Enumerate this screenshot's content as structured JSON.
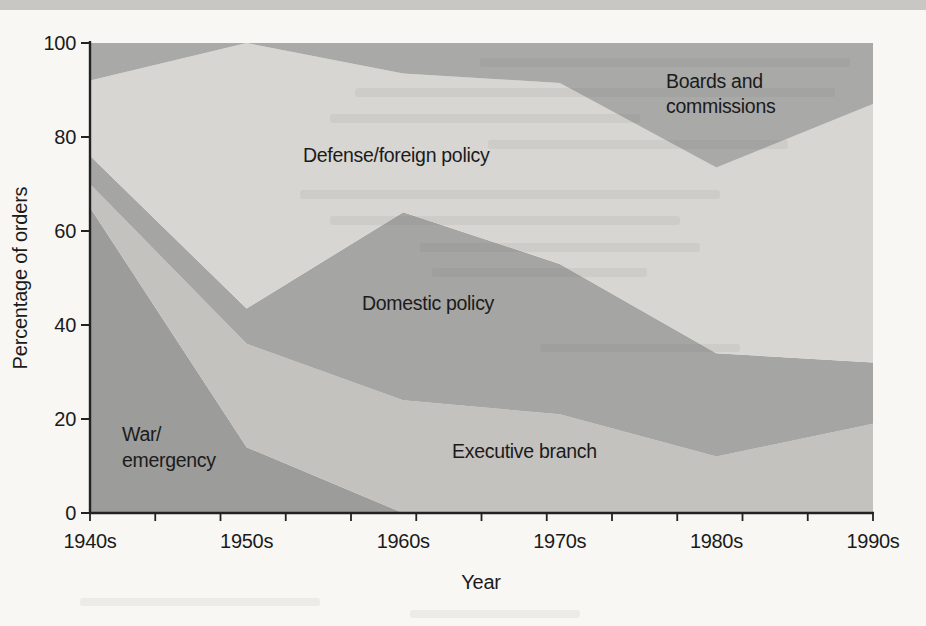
{
  "page": {
    "top_bar_color": "#c8c7c4",
    "background_color": "#f8f7f4",
    "text_color": "#1b1b1b",
    "axis_color": "#222222"
  },
  "chart_data": {
    "type": "area",
    "stacked": true,
    "unit": "percent",
    "title": "",
    "xlabel": "Year",
    "ylabel": "Percentage of orders",
    "ylim": [
      0,
      100
    ],
    "y_ticks": [
      0,
      20,
      40,
      60,
      80,
      100
    ],
    "x_minor_tick_count": 13,
    "categories": [
      "1940s",
      "1950s",
      "1960s",
      "1970s",
      "1980s",
      "1990s"
    ],
    "grid": false,
    "legend_position": "inline-area-labels",
    "series": [
      {
        "name": "War/emergency",
        "label_lines": [
          "War/",
          "emergency"
        ],
        "color": "#9c9c9a",
        "values": [
          65,
          14,
          0,
          0,
          0,
          0
        ]
      },
      {
        "name": "Executive branch",
        "label_lines": [
          "Executive branch"
        ],
        "color": "#c3c2bf",
        "values": [
          5,
          22,
          24,
          21,
          12,
          19
        ]
      },
      {
        "name": "Domestic policy",
        "label_lines": [
          "Domestic policy"
        ],
        "color": "#a5a5a3",
        "values": [
          6,
          7.5,
          40,
          32,
          22,
          13
        ]
      },
      {
        "name": "Defense/foreign policy",
        "label_lines": [
          "Defense/foreign policy"
        ],
        "color": "#d7d6d2",
        "values": [
          16,
          56.5,
          29.5,
          38.5,
          39.5,
          55
        ]
      },
      {
        "name": "Boards and commissions",
        "label_lines": [
          "Boards and",
          "commissions"
        ],
        "color": "#a9a9a7",
        "values": [
          8,
          0,
          6.5,
          8.5,
          26.5,
          13
        ]
      }
    ]
  }
}
